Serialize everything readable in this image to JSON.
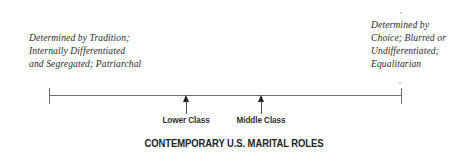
{
  "figure": {
    "title": "CONTEMPORARY U.S. MARITAL ROLES",
    "type": "continuum-diagram",
    "axis": {
      "orientation": "horizontal",
      "left_endpoint_label_lines": [
        "Determined by Tradition;",
        "Internally Differentiated",
        "and Segregated; Patriarchal"
      ],
      "right_endpoint_label_lines": [
        "Determined by",
        "Choice; Blurred or",
        "Undifferentiated;",
        "Equalitarian"
      ]
    },
    "markers": [
      {
        "label": "Lower Class",
        "position_pct": 39
      },
      {
        "label": "Middle Class",
        "position_pct": 60
      }
    ],
    "colors": {
      "axis_line": "#6d6d6d",
      "marker": "#1a1a1a",
      "text": "#2b2b2b",
      "background": "#ffffff"
    }
  }
}
